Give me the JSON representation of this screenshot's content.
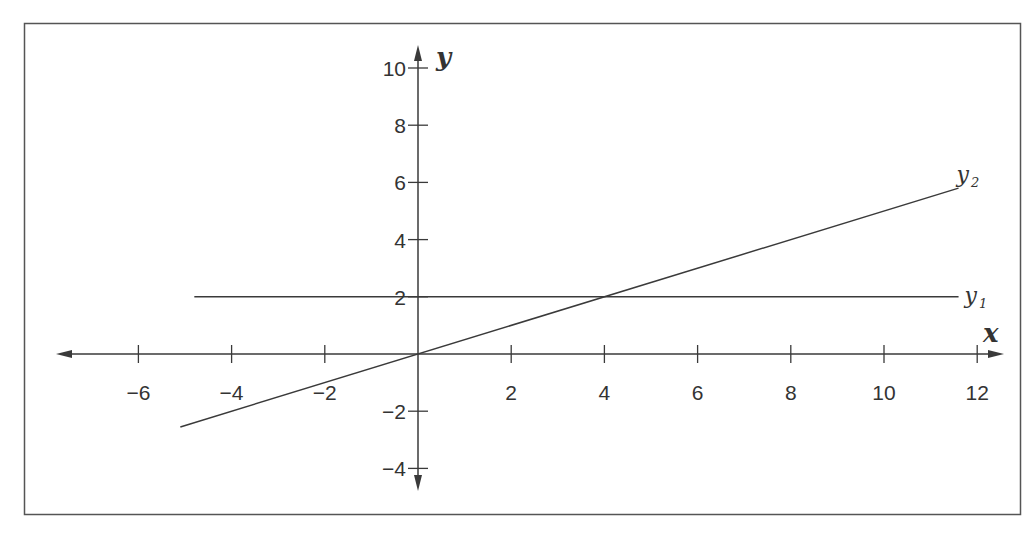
{
  "chart_data": {
    "type": "line",
    "title": "",
    "xlabel": "x",
    "ylabel": "y",
    "xlim": [
      -7.6,
      12.7
    ],
    "ylim": [
      -4.9,
      10.9
    ],
    "grid": false,
    "x_ticks": [
      -6,
      -4,
      -2,
      2,
      4,
      6,
      8,
      10,
      12
    ],
    "y_ticks": [
      -4,
      -2,
      2,
      4,
      6,
      8,
      10
    ],
    "x_tick_labels": [
      "−6",
      "−4",
      "−2",
      "2",
      "4",
      "6",
      "8",
      "10",
      "12"
    ],
    "y_tick_labels": [
      "−4",
      "−2",
      "2",
      "4",
      "6",
      "8",
      "10"
    ],
    "series": [
      {
        "name": "y1",
        "label_main": "y",
        "label_sub": "1",
        "x": [
          -4.8,
          11.6
        ],
        "y": [
          2,
          2
        ]
      },
      {
        "name": "y2",
        "label_main": "y",
        "label_sub": "2",
        "x": [
          -5.1,
          11.6
        ],
        "y": [
          -2.55,
          5.8
        ]
      }
    ],
    "intersection": [
      4,
      2
    ],
    "colors": {
      "line": "#3a3a3a",
      "frame": "#555555",
      "text": "#333333"
    }
  }
}
